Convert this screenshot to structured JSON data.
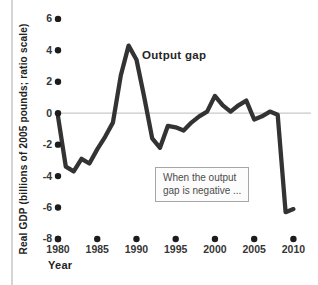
{
  "chart": {
    "y_axis": {
      "label": "Real GDP (billions of 2005 pounds; ratio scale)",
      "tick_labels": [
        "6",
        "4",
        "2",
        "0",
        "-2",
        "-4",
        "-6",
        "-8"
      ],
      "tick_values": [
        6,
        4,
        2,
        0,
        -2,
        -4,
        -6,
        -8
      ]
    },
    "x_axis": {
      "label": "Year",
      "tick_labels": [
        "1980",
        "1985",
        "1990",
        "1995",
        "2000",
        "2005",
        "2010"
      ],
      "tick_values": [
        1980,
        1985,
        1990,
        1995,
        2000,
        2005,
        2010
      ]
    },
    "series_label": "Output gap",
    "annotation": {
      "line1": "When the output",
      "line2": "gap is negative ..."
    },
    "colors": {
      "line": "#333333",
      "dot": "#1c1c1c",
      "zero_line": "#c9c9c9",
      "text": "#363636",
      "annotation_border": "#a6a6a6",
      "page_edge": "#d4d4d4"
    }
  },
  "chart_data": {
    "type": "line",
    "title": "",
    "xlabel": "Year",
    "ylabel": "Real GDP (billions of 2005 pounds; ratio scale)",
    "xlim": [
      1980,
      2010
    ],
    "ylim": [
      -8,
      6
    ],
    "x_ticks": [
      1980,
      1985,
      1990,
      1995,
      2000,
      2005,
      2010
    ],
    "y_ticks": [
      6,
      4,
      2,
      0,
      -2,
      -4,
      -6,
      -8
    ],
    "zero_line": true,
    "grid": false,
    "legend": "inline-label",
    "series": [
      {
        "name": "Output gap",
        "x": [
          1980,
          1981,
          1982,
          1983,
          1984,
          1985,
          1986,
          1987,
          1988,
          1989,
          1990,
          1991,
          1992,
          1993,
          1994,
          1995,
          1996,
          1997,
          1998,
          1999,
          2000,
          2001,
          2002,
          2003,
          2004,
          2005,
          2006,
          2007,
          2008,
          2009,
          2010
        ],
        "values": [
          -0.2,
          -3.4,
          -3.7,
          -2.9,
          -3.2,
          -2.3,
          -1.5,
          -0.6,
          2.4,
          4.3,
          3.4,
          1.0,
          -1.6,
          -2.2,
          -0.8,
          -0.9,
          -1.1,
          -0.6,
          -0.2,
          0.1,
          1.1,
          0.5,
          0.1,
          0.5,
          0.8,
          -0.4,
          -0.2,
          0.1,
          -0.1,
          -6.3,
          -6.1
        ]
      }
    ],
    "annotations": [
      "When the output gap is negative ..."
    ]
  }
}
